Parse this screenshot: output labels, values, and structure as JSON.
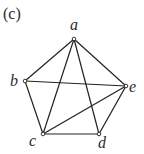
{
  "figure": {
    "panel_label": "(c)",
    "panel_label_pos": [
      3,
      19
    ],
    "vertices": [
      {
        "id": "a",
        "label": "a",
        "x": 74,
        "y": 39,
        "lx": 70,
        "ly": 30
      },
      {
        "id": "b",
        "label": "b",
        "x": 25,
        "y": 81,
        "lx": 10,
        "ly": 86
      },
      {
        "id": "c",
        "label": "c",
        "x": 43,
        "y": 134,
        "lx": 29,
        "ly": 146
      },
      {
        "id": "d",
        "label": "d",
        "x": 99,
        "y": 134,
        "lx": 98,
        "ly": 148
      },
      {
        "id": "e",
        "label": "e",
        "x": 126,
        "y": 86,
        "lx": 129,
        "ly": 92
      }
    ],
    "edges": [
      [
        "a",
        "b"
      ],
      [
        "a",
        "e"
      ],
      [
        "a",
        "c"
      ],
      [
        "a",
        "d"
      ],
      [
        "b",
        "e"
      ],
      [
        "b",
        "c"
      ],
      [
        "c",
        "e"
      ],
      [
        "c",
        "d"
      ],
      [
        "d",
        "e"
      ]
    ],
    "colors": {
      "stroke": "#222222",
      "background": "#ffffff"
    }
  }
}
